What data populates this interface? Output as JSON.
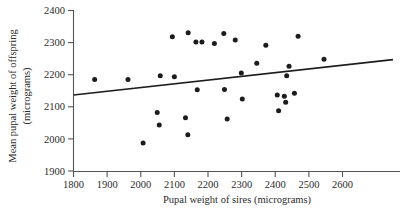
{
  "chart_data": {
    "type": "scatter",
    "title": "",
    "xlabel": "Pupal weight of sires (micrograms)",
    "ylabel": "Mean pupal weight of offspring (micrograms)",
    "ylabel_line1": "Mean pupal weight of offspring",
    "ylabel_line2": "(micrograms)",
    "xlim": [
      1800,
      2600
    ],
    "ylim": [
      1900,
      2400
    ],
    "xticks": [
      1800,
      1900,
      2000,
      2100,
      2200,
      2300,
      2400,
      2500,
      2600
    ],
    "yticks": [
      1900,
      2000,
      2100,
      2200,
      2300,
      2400
    ],
    "xtick_labels": [
      "1800",
      "1900",
      "2000",
      "2100",
      "2200",
      "2300",
      "2400",
      "2500",
      "2600"
    ],
    "ytick_labels": [
      "1900",
      "2000",
      "2100",
      "2200",
      "2300",
      "2400"
    ],
    "grid": false,
    "legend": "none",
    "point_color": "#1c1c1c",
    "line_color": "#1c1c1c",
    "axis_color": "#555555",
    "points": [
      {
        "x": 1863,
        "y": 2185
      },
      {
        "x": 1962,
        "y": 2185
      },
      {
        "x": 2007,
        "y": 1987
      },
      {
        "x": 2049,
        "y": 2082
      },
      {
        "x": 2055,
        "y": 2043
      },
      {
        "x": 2058,
        "y": 2197
      },
      {
        "x": 2094,
        "y": 2318
      },
      {
        "x": 2100,
        "y": 2194
      },
      {
        "x": 2133,
        "y": 2066
      },
      {
        "x": 2140,
        "y": 2013
      },
      {
        "x": 2141,
        "y": 2331
      },
      {
        "x": 2164,
        "y": 2302
      },
      {
        "x": 2182,
        "y": 2302
      },
      {
        "x": 2168,
        "y": 2153
      },
      {
        "x": 2219,
        "y": 2297
      },
      {
        "x": 2247,
        "y": 2328
      },
      {
        "x": 2249,
        "y": 2154
      },
      {
        "x": 2257,
        "y": 2062
      },
      {
        "x": 2281,
        "y": 2308
      },
      {
        "x": 2299,
        "y": 2205
      },
      {
        "x": 2302,
        "y": 2124
      },
      {
        "x": 2345,
        "y": 2236
      },
      {
        "x": 2372,
        "y": 2292
      },
      {
        "x": 2406,
        "y": 2137
      },
      {
        "x": 2410,
        "y": 2088
      },
      {
        "x": 2427,
        "y": 2133
      },
      {
        "x": 2431,
        "y": 2114
      },
      {
        "x": 2434,
        "y": 2197
      },
      {
        "x": 2441,
        "y": 2226
      },
      {
        "x": 2457,
        "y": 2142
      },
      {
        "x": 2468,
        "y": 2320
      },
      {
        "x": 2545,
        "y": 2248
      }
    ],
    "trend_line": {
      "x_start": 1800,
      "y_start": 2137,
      "x_end": 2750,
      "y_end": 2247
    }
  }
}
